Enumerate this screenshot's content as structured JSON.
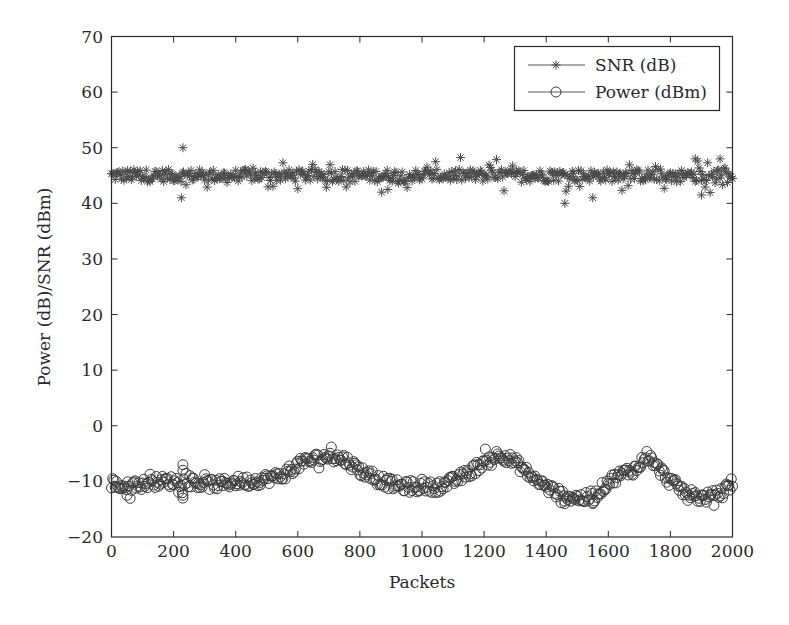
{
  "chart_data": {
    "type": "scatter",
    "title": "",
    "xlabel": "Packets",
    "ylabel": "Power (dB)/SNR (dBm)",
    "xlim": [
      0,
      2000
    ],
    "ylim": [
      -20,
      70
    ],
    "xticks": [
      0,
      200,
      400,
      600,
      800,
      1000,
      1200,
      1400,
      1600,
      1800,
      2000
    ],
    "yticks": [
      -20,
      -10,
      0,
      10,
      20,
      30,
      40,
      50,
      60,
      70
    ],
    "xtick_labels": [
      "0",
      "200",
      "400",
      "600",
      "800",
      "1000",
      "1200",
      "1400",
      "1600",
      "1800",
      "2000"
    ],
    "ytick_labels": [
      "−20",
      "−10",
      "0",
      "10",
      "20",
      "30",
      "40",
      "50",
      "60",
      "70"
    ],
    "grid": false,
    "legend_position": "upper right",
    "legend": [
      {
        "label": "SNR (dB)",
        "marker": "asterisk"
      },
      {
        "label": "Power (dBm)",
        "marker": "circle"
      }
    ],
    "series": [
      {
        "name": "SNR (dB)",
        "marker": "asterisk",
        "color": "#555555",
        "x": [
          0,
          50,
          100,
          150,
          200,
          230,
          250,
          300,
          350,
          400,
          450,
          500,
          550,
          600,
          650,
          700,
          750,
          800,
          850,
          900,
          950,
          1000,
          1050,
          1100,
          1150,
          1200,
          1250,
          1300,
          1350,
          1400,
          1450,
          1500,
          1550,
          1600,
          1650,
          1700,
          1750,
          1800,
          1850,
          1900,
          1950,
          2000
        ],
        "values": [
          45,
          45,
          45,
          45,
          45,
          50,
          44,
          45,
          45,
          45,
          45,
          45,
          45,
          45,
          45,
          45,
          45,
          45,
          45,
          44,
          45,
          45,
          45,
          45,
          45,
          45,
          45,
          45,
          45,
          45,
          44,
          46,
          45,
          45,
          45,
          45,
          45,
          45,
          45,
          45,
          45,
          44
        ],
        "range_min": 40,
        "range_max": 50,
        "typical": 45
      },
      {
        "name": "Power (dBm)",
        "marker": "circle",
        "color": "#444444",
        "x": [
          0,
          50,
          100,
          150,
          200,
          250,
          300,
          350,
          400,
          450,
          500,
          550,
          600,
          650,
          700,
          750,
          800,
          850,
          900,
          950,
          1000,
          1050,
          1100,
          1150,
          1200,
          1250,
          1300,
          1350,
          1400,
          1450,
          1500,
          1550,
          1600,
          1650,
          1700,
          1720,
          1750,
          1800,
          1850,
          1900,
          1950,
          2000
        ],
        "values": [
          -10.5,
          -11,
          -10.5,
          -10,
          -10,
          -10,
          -10.5,
          -10.5,
          -10,
          -10,
          -9.5,
          -9,
          -7,
          -6,
          -5.5,
          -6,
          -8,
          -9.5,
          -10.5,
          -11,
          -11,
          -11,
          -10,
          -8.5,
          -6.5,
          -5,
          -6.5,
          -9,
          -11,
          -12.5,
          -13,
          -13,
          -10,
          -8.5,
          -7.5,
          -5,
          -7,
          -10,
          -12,
          -13,
          -12.5,
          -11
        ]
      }
    ]
  }
}
